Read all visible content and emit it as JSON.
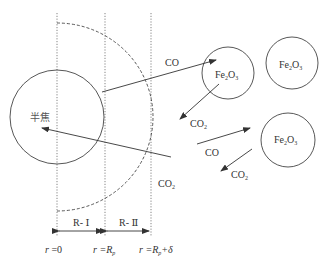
{
  "diagram": {
    "core_particle": {
      "label": "半焦"
    },
    "regions": [
      {
        "label": "R- Ⅰ"
      },
      {
        "label": "R- Ⅱ"
      }
    ],
    "boundaries": [
      {
        "label_r": "r",
        "label_eq": " =0"
      },
      {
        "label_r": "r",
        "label_eq": " =R",
        "sub": "p"
      },
      {
        "label_r": "r",
        "label_eq": " =R",
        "sub": "p",
        "suffix": "+δ"
      }
    ],
    "oxide_particles": [
      {
        "label_main": "Fe",
        "sub1": "2",
        "mid": "O",
        "sub2": "3"
      },
      {
        "label_main": "Fe",
        "sub1": "2",
        "mid": "O",
        "sub2": "3"
      },
      {
        "label_main": "Fe",
        "sub1": "2",
        "mid": "O",
        "sub2": "3"
      }
    ],
    "species": {
      "co_1": "CO",
      "co2_1": "CO",
      "co2_1_sub": "2",
      "co2_return": "CO",
      "co2_return_sub": "2",
      "co_2": "CO",
      "co2_2": "CO",
      "co2_2_sub": "2"
    },
    "colors": {
      "line": "#444444",
      "background": "#ffffff"
    }
  }
}
